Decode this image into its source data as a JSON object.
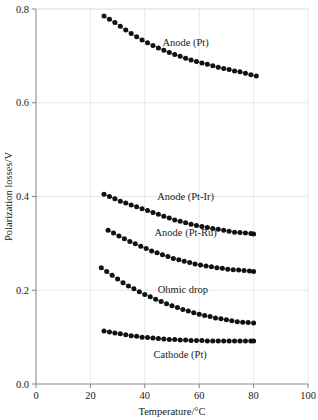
{
  "chart_data": {
    "type": "scatter",
    "title": "",
    "xlabel": "Temperature/°C",
    "ylabel": "Polarization losses/V",
    "xlim": [
      0,
      100
    ],
    "ylim": [
      0.0,
      0.8
    ],
    "xticks": [
      0,
      20,
      40,
      60,
      80,
      100
    ],
    "xticklabels": [
      "0",
      "20",
      "40",
      "60",
      "80",
      "100"
    ],
    "yticks": [
      0.0,
      0.2,
      0.4,
      0.6,
      0.8
    ],
    "yticklabels": [
      "0.0",
      "0.2",
      "0.4",
      "0.6",
      "0.8"
    ],
    "grid": true,
    "legend_position": "inline-annotations",
    "marker": "filled-circle",
    "series": [
      {
        "name": "Anode (Pt)",
        "label": "Anode (Pt)",
        "label_x": 55,
        "label_y": 0.722,
        "x": [
          25,
          27,
          29,
          31,
          33,
          35,
          37,
          39,
          41,
          43,
          45,
          47,
          49,
          51,
          53,
          55,
          57,
          59,
          61,
          63,
          65,
          67,
          69,
          71,
          73,
          75,
          77,
          79,
          81
        ],
        "y": [
          0.785,
          0.778,
          0.771,
          0.763,
          0.755,
          0.748,
          0.741,
          0.734,
          0.728,
          0.722,
          0.717,
          0.712,
          0.707,
          0.703,
          0.699,
          0.695,
          0.691,
          0.688,
          0.685,
          0.682,
          0.679,
          0.676,
          0.673,
          0.671,
          0.668,
          0.666,
          0.663,
          0.66,
          0.657
        ]
      },
      {
        "name": "Anode (Pt-Ir)",
        "label": "Anode (Pt-Ir)",
        "label_x": 55,
        "label_y": 0.392,
        "x": [
          25,
          27,
          29,
          31,
          33,
          35,
          37,
          39,
          41,
          43,
          45,
          47,
          49,
          51,
          53,
          55,
          57,
          59,
          61,
          63,
          65,
          67,
          69,
          71,
          73,
          75,
          77,
          79,
          80
        ],
        "y": [
          0.405,
          0.4,
          0.395,
          0.39,
          0.386,
          0.382,
          0.378,
          0.374,
          0.37,
          0.366,
          0.362,
          0.358,
          0.354,
          0.35,
          0.347,
          0.344,
          0.341,
          0.338,
          0.336,
          0.334,
          0.332,
          0.33,
          0.328,
          0.326,
          0.324,
          0.323,
          0.322,
          0.321,
          0.32
        ]
      },
      {
        "name": "Anode (Pt-Ru)",
        "label": "Anode (Pt-Ru)",
        "label_x": 55,
        "label_y": 0.315,
        "x": [
          26.5,
          28.5,
          30.5,
          32.5,
          34.5,
          36.5,
          38.5,
          40.5,
          42.5,
          44.5,
          46.5,
          48.5,
          50.5,
          52.5,
          54.5,
          56.5,
          58.5,
          60.5,
          62.5,
          64.5,
          66.5,
          68.5,
          70.5,
          72.5,
          74.5,
          76.5,
          78.5,
          80
        ],
        "y": [
          0.328,
          0.322,
          0.316,
          0.31,
          0.304,
          0.299,
          0.294,
          0.289,
          0.284,
          0.28,
          0.276,
          0.272,
          0.268,
          0.265,
          0.262,
          0.259,
          0.256,
          0.254,
          0.252,
          0.25,
          0.248,
          0.247,
          0.245,
          0.244,
          0.243,
          0.242,
          0.241,
          0.24
        ]
      },
      {
        "name": "Ohmic drop",
        "label": "Ohmic drop",
        "label_x": 54,
        "label_y": 0.195,
        "x": [
          24,
          26,
          28,
          30,
          32,
          34,
          36,
          38,
          40,
          42,
          44,
          46,
          48,
          50,
          52,
          54,
          56,
          58,
          60,
          62,
          64,
          66,
          68,
          70,
          72,
          74,
          76,
          78,
          80
        ],
        "y": [
          0.248,
          0.24,
          0.232,
          0.224,
          0.216,
          0.209,
          0.203,
          0.197,
          0.191,
          0.186,
          0.181,
          0.176,
          0.171,
          0.167,
          0.163,
          0.159,
          0.156,
          0.152,
          0.149,
          0.146,
          0.144,
          0.141,
          0.139,
          0.137,
          0.135,
          0.133,
          0.132,
          0.131,
          0.13
        ]
      },
      {
        "name": "Cathode (Pt)",
        "label": "Cathode (Pt)",
        "label_x": 53,
        "label_y": 0.055,
        "x": [
          25,
          27,
          29,
          31,
          33,
          35,
          37,
          39,
          41,
          43,
          45,
          47,
          49,
          51,
          53,
          55,
          57,
          59,
          61,
          63,
          65,
          67,
          69,
          71,
          73,
          75,
          77,
          79,
          80
        ],
        "y": [
          0.113,
          0.111,
          0.109,
          0.107,
          0.105,
          0.103,
          0.102,
          0.1,
          0.099,
          0.098,
          0.097,
          0.096,
          0.095,
          0.095,
          0.094,
          0.094,
          0.093,
          0.093,
          0.093,
          0.092,
          0.092,
          0.092,
          0.092,
          0.092,
          0.092,
          0.092,
          0.092,
          0.092,
          0.092
        ]
      }
    ]
  },
  "colors": {
    "marker": "#111111",
    "grid": "#e2e2e2",
    "axis": "#8c8c8c",
    "text": "#1a1a1a",
    "background": "#ffffff"
  }
}
